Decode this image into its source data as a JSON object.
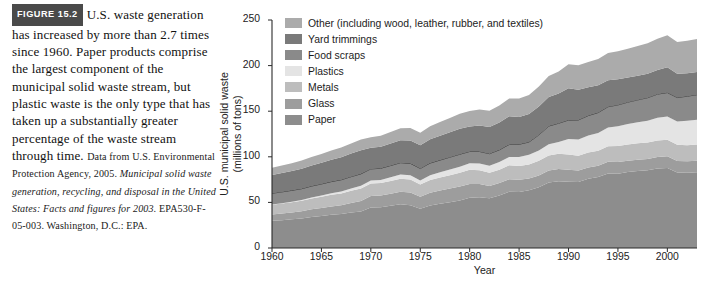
{
  "figure": {
    "badge": "FIGURE 15.2",
    "caption_main": "U.S. waste generation has increased by more than 2.7 times since 1960. Paper products comprise the largest component of the municipal solid waste stream, but plastic waste is the only type that has taken up a substantially greater percentage of the waste stream through time.",
    "source_lead": "Data from U.S. Environmental Protection Agency, 2005.",
    "source_italic": "Municipal solid waste generation, recycling, and disposal in the United States: Facts and figures for 2003.",
    "source_tail": "EPA530-F-05-003. Washington, D.C.: EPA."
  },
  "chart_data": {
    "type": "area",
    "title": "",
    "xlabel": "Year",
    "ylabel": "U.S. municipal solid waste (millions of tons)",
    "xlim": [
      1960,
      2003
    ],
    "ylim": [
      0,
      250
    ],
    "xticks": [
      1960,
      1965,
      1970,
      1975,
      1980,
      1985,
      1990,
      1995,
      2000
    ],
    "yticks": [
      0,
      50,
      100,
      150,
      200,
      250
    ],
    "grid": false,
    "legend_position": "top-left",
    "stacked": true,
    "x": [
      1960,
      1961,
      1962,
      1963,
      1964,
      1965,
      1966,
      1967,
      1968,
      1969,
      1970,
      1971,
      1972,
      1973,
      1974,
      1975,
      1976,
      1977,
      1978,
      1979,
      1980,
      1981,
      1982,
      1983,
      1984,
      1985,
      1986,
      1987,
      1988,
      1989,
      1990,
      1991,
      1992,
      1993,
      1994,
      1995,
      1996,
      1997,
      1998,
      1999,
      2000,
      2001,
      2002,
      2003
    ],
    "series": [
      {
        "name": "Paper",
        "color": "#8d8d8d",
        "values": [
          29.9,
          30.5,
          31.4,
          32.4,
          34.1,
          35.2,
          36.4,
          37.2,
          38.8,
          40.0,
          44.3,
          44.6,
          46.3,
          48.1,
          46.9,
          43.0,
          46.5,
          48.5,
          50.2,
          52.0,
          55.2,
          55.6,
          54.6,
          57.7,
          61.6,
          61.5,
          63.2,
          66.6,
          71.8,
          73.3,
          72.7,
          72.5,
          76.0,
          77.8,
          81.7,
          81.5,
          83.2,
          84.5,
          85.2,
          87.1,
          87.7,
          82.8,
          82.6,
          83.1
        ]
      },
      {
        "name": "Glass",
        "color": "#9d9d9d",
        "values": [
          6.7,
          7.2,
          7.6,
          7.9,
          8.4,
          8.7,
          9.2,
          9.8,
          10.5,
          11.5,
          12.7,
          12.9,
          13.1,
          13.5,
          13.9,
          13.2,
          14.1,
          14.6,
          15.1,
          15.5,
          15.1,
          14.5,
          13.4,
          13.5,
          13.9,
          13.2,
          12.9,
          13.0,
          13.2,
          13.2,
          13.1,
          12.5,
          12.2,
          12.3,
          12.8,
          12.8,
          12.6,
          12.4,
          12.5,
          12.8,
          12.8,
          12.6,
          12.4,
          12.5
        ]
      },
      {
        "name": "Metals",
        "color": "#bdbdbd",
        "values": [
          10.8,
          11.0,
          11.2,
          11.5,
          11.9,
          12.2,
          12.7,
          12.8,
          13.4,
          13.8,
          13.8,
          13.7,
          14.1,
          14.4,
          14.2,
          13.3,
          14.0,
          14.2,
          14.6,
          14.9,
          15.5,
          15.2,
          14.4,
          14.6,
          15.2,
          15.3,
          15.5,
          16.0,
          16.5,
          16.8,
          16.6,
          16.2,
          16.4,
          16.6,
          17.2,
          17.6,
          17.8,
          17.9,
          18.0,
          18.1,
          18.2,
          17.8,
          17.7,
          17.8
        ]
      },
      {
        "name": "Plastics",
        "color": "#e4e4e4",
        "values": [
          0.4,
          0.5,
          0.6,
          0.7,
          0.9,
          1.4,
          1.7,
          2.1,
          2.5,
          2.9,
          3.1,
          3.4,
          4.0,
          4.5,
          4.7,
          4.5,
          5.2,
          5.7,
          6.2,
          6.8,
          7.0,
          7.4,
          7.8,
          8.4,
          9.2,
          9.9,
          10.6,
          11.4,
          12.2,
          13.0,
          17.1,
          17.9,
          18.8,
          19.5,
          20.4,
          21.7,
          22.4,
          23.0,
          23.8,
          24.7,
          25.5,
          25.4,
          26.7,
          27.2
        ]
      },
      {
        "name": "Food scraps",
        "color": "#8a8a8a",
        "values": [
          12.2,
          12.3,
          12.4,
          12.5,
          12.6,
          12.7,
          12.8,
          12.9,
          13.0,
          13.1,
          12.8,
          12.8,
          12.9,
          13.0,
          13.1,
          13.2,
          13.3,
          13.4,
          13.5,
          13.6,
          13.0,
          13.1,
          13.2,
          13.4,
          13.6,
          13.8,
          14.0,
          17.0,
          20.0,
          20.5,
          20.8,
          21.3,
          21.8,
          22.3,
          22.8,
          23.3,
          23.9,
          24.6,
          25.3,
          26.0,
          26.2,
          26.4,
          27.0,
          27.5
        ]
      },
      {
        "name": "Yard trimmings",
        "color": "#7a7a7a",
        "values": [
          20.0,
          20.6,
          21.2,
          21.9,
          22.6,
          23.2,
          23.9,
          24.6,
          25.3,
          26.0,
          23.2,
          23.6,
          24.1,
          24.6,
          25.1,
          25.6,
          26.2,
          26.8,
          27.4,
          28.0,
          27.5,
          28.4,
          29.2,
          30.1,
          31.0,
          30.0,
          30.6,
          31.2,
          31.8,
          32.5,
          35.0,
          33.0,
          31.0,
          30.0,
          29.0,
          28.0,
          27.0,
          26.6,
          26.3,
          26.5,
          27.7,
          26.0,
          25.2,
          24.8
        ]
      },
      {
        "name": "Other (including wood, leather, rubber, and textiles)",
        "color": "#ababab",
        "values": [
          8.0,
          8.3,
          8.6,
          9.0,
          9.4,
          9.8,
          10.2,
          10.7,
          11.2,
          11.7,
          11.6,
          12.0,
          12.6,
          13.2,
          13.6,
          13.5,
          14.2,
          14.9,
          15.6,
          16.3,
          17.0,
          17.6,
          17.8,
          18.5,
          19.4,
          20.1,
          21.0,
          22.0,
          23.2,
          24.3,
          26.2,
          26.9,
          27.8,
          28.6,
          29.8,
          30.7,
          31.6,
          32.5,
          33.4,
          34.2,
          35.2,
          35.0,
          35.6,
          36.2
        ]
      }
    ],
    "legend": [
      {
        "label": "Other (including wood, leather, rubber, and textiles)",
        "color": "#ababab"
      },
      {
        "label": "Yard trimmings",
        "color": "#7a7a7a"
      },
      {
        "label": "Food scraps",
        "color": "#8a8a8a"
      },
      {
        "label": "Plastics",
        "color": "#e4e4e4"
      },
      {
        "label": "Metals",
        "color": "#bdbdbd"
      },
      {
        "label": "Glass",
        "color": "#9d9d9d"
      },
      {
        "label": "Paper",
        "color": "#8d8d8d"
      }
    ]
  }
}
